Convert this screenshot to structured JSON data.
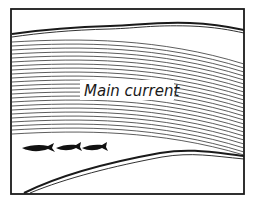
{
  "diagram": {
    "label": "Main current",
    "fish_count": 3,
    "colors": {
      "ink": "#1a1a1a",
      "background": "#ffffff"
    },
    "elements": {
      "frame": "rectangular border",
      "upper_bank": "wavy double line near top",
      "lower_bank": "curved double line rising from bottom-left",
      "current_lines": "many parallel curved hatch lines",
      "fish": "three black fish swimming right below the current"
    }
  }
}
